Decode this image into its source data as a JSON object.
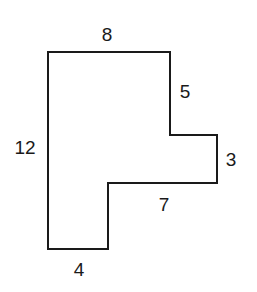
{
  "diagram": {
    "type": "rectilinear-polygon",
    "stroke_color": "#1a1a1a",
    "stroke_width": 2,
    "fill_color": "#ffffff",
    "vertices": [
      [
        48,
        52
      ],
      [
        170,
        52
      ],
      [
        170,
        135
      ],
      [
        217,
        135
      ],
      [
        217,
        183
      ],
      [
        108,
        183
      ],
      [
        108,
        249
      ],
      [
        48,
        249
      ]
    ],
    "labels": {
      "top": "8",
      "upper_right": "5",
      "right_step": "3",
      "inner_bottom": "7",
      "bottom": "4",
      "left": "12"
    }
  }
}
